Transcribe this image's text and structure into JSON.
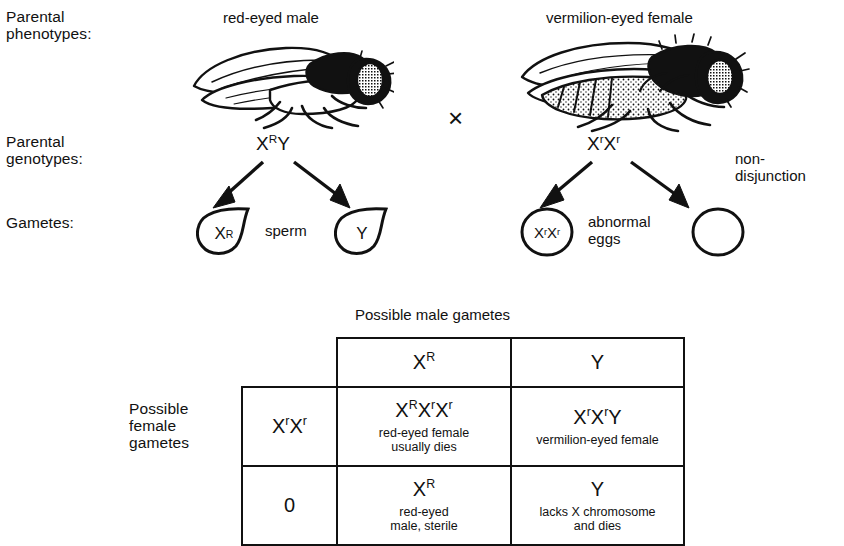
{
  "row_labels": {
    "phenotypes": "Parental\nphenotypes:",
    "genotypes": "Parental\ngenotypes:",
    "gametes": "Gametes:"
  },
  "parents": {
    "male": {
      "phenotype": "red-eyed male",
      "genotype_main": "X",
      "genotype_sup": "R",
      "genotype_tail": "Y",
      "gamete_label": "sperm",
      "gametes": [
        {
          "symbol": "X",
          "sup": "R",
          "tail": ""
        },
        {
          "symbol": "Y",
          "sup": "",
          "tail": ""
        }
      ]
    },
    "female": {
      "phenotype": "vermilion-eyed female",
      "genotype_main": "X",
      "genotype_sup": "r",
      "genotype_tail": "X",
      "genotype_sup2": "r",
      "gamete_label": "abnormal\neggs",
      "nondisjunction_label": "non-\ndisjunction",
      "gametes": [
        {
          "symbol": "X",
          "sup": "r",
          "tail": "X",
          "sup2": "r"
        },
        {
          "symbol": "",
          "sup": "",
          "tail": ""
        }
      ]
    },
    "cross_symbol": "×"
  },
  "punnett": {
    "top_title": "Possible male gametes",
    "side_title": "Possible\nfemale\ngametes",
    "col_headers": [
      {
        "symbol": "X",
        "sup": "R"
      },
      {
        "symbol": "Y",
        "sup": ""
      }
    ],
    "rows": [
      {
        "header": {
          "parts": [
            {
              "base": "X",
              "sup": "r"
            },
            {
              "base": "X",
              "sup": "r"
            }
          ]
        },
        "cells": [
          {
            "genotype_parts": [
              {
                "base": "X",
                "sup": "R"
              },
              {
                "base": "X",
                "sup": "r"
              },
              {
                "base": "X",
                "sup": "r"
              }
            ],
            "note": "red-eyed female\nusually dies"
          },
          {
            "genotype_parts": [
              {
                "base": "X",
                "sup": "r"
              },
              {
                "base": "X",
                "sup": "r"
              },
              {
                "base": "Y",
                "sup": ""
              }
            ],
            "note": "vermilion-eyed female"
          }
        ]
      },
      {
        "header": {
          "text": "0"
        },
        "cells": [
          {
            "genotype_parts": [
              {
                "base": "X",
                "sup": "R"
              }
            ],
            "note": "red-eyed\nmale, sterile"
          },
          {
            "genotype_parts": [
              {
                "base": "Y",
                "sup": ""
              }
            ],
            "note": "lacks X chromosome\nand dies"
          }
        ]
      }
    ]
  },
  "colors": {
    "ink": "#111111",
    "background": "#ffffff"
  }
}
